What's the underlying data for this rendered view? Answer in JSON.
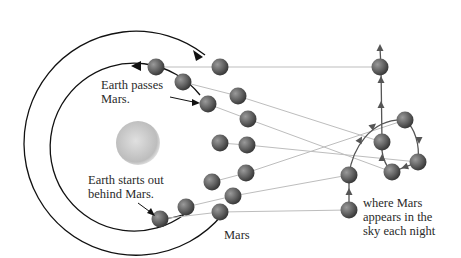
{
  "diagram": {
    "labels": {
      "earth_passes": [
        "Earth passes",
        "Mars."
      ],
      "earth_starts": [
        "Earth starts out",
        "behind Mars."
      ],
      "mars": "Mars",
      "sky": [
        "where Mars",
        "appears in the",
        "sky each night"
      ]
    },
    "objects": {
      "sun": "sun",
      "inner_orbit": "Earth orbit",
      "outer_orbit": "Mars orbit",
      "earth_positions_count": 7,
      "mars_positions_count": 7,
      "sky_positions_count": 7
    },
    "colors": {
      "orbit": "#111111",
      "sight_line": "#bdbdbd",
      "sky_path": "#555555",
      "planet": "#6a6a6a",
      "sun": "#c8c8c8"
    }
  }
}
